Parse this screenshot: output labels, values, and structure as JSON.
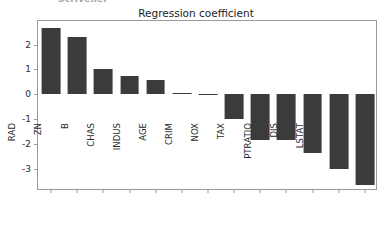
{
  "figure": {
    "clipped_top_text": "Scrivener",
    "title": "Regression coefficient",
    "background_color": "#ffffff",
    "bar_color": "#3b3b3b",
    "axis_color": "#9a9a9a"
  },
  "chart_data": {
    "type": "bar",
    "title": "Regression coefficient",
    "xlabel": "",
    "ylabel": "",
    "categories": [
      "RM",
      "RAD",
      "ZN",
      "B",
      "CHAS",
      "INDUS",
      "AGE",
      "CRIM",
      "NOX",
      "TAX",
      "PTRATIO",
      "DIS",
      "LSTAT"
    ],
    "values": [
      2.66,
      2.3,
      1.0,
      0.72,
      0.56,
      0.05,
      -0.05,
      -1.0,
      -1.85,
      -1.85,
      -2.35,
      -3.0,
      -3.65
    ],
    "ylim": [
      -3.9,
      2.95
    ],
    "yticks": [
      2,
      1,
      0,
      -1,
      -2,
      -3
    ],
    "ytick_labels": [
      "2",
      "1",
      "0",
      "-1",
      "-2",
      "-3"
    ],
    "grid": false,
    "legend": null,
    "orientation": "vertical",
    "sorted": "descending"
  }
}
